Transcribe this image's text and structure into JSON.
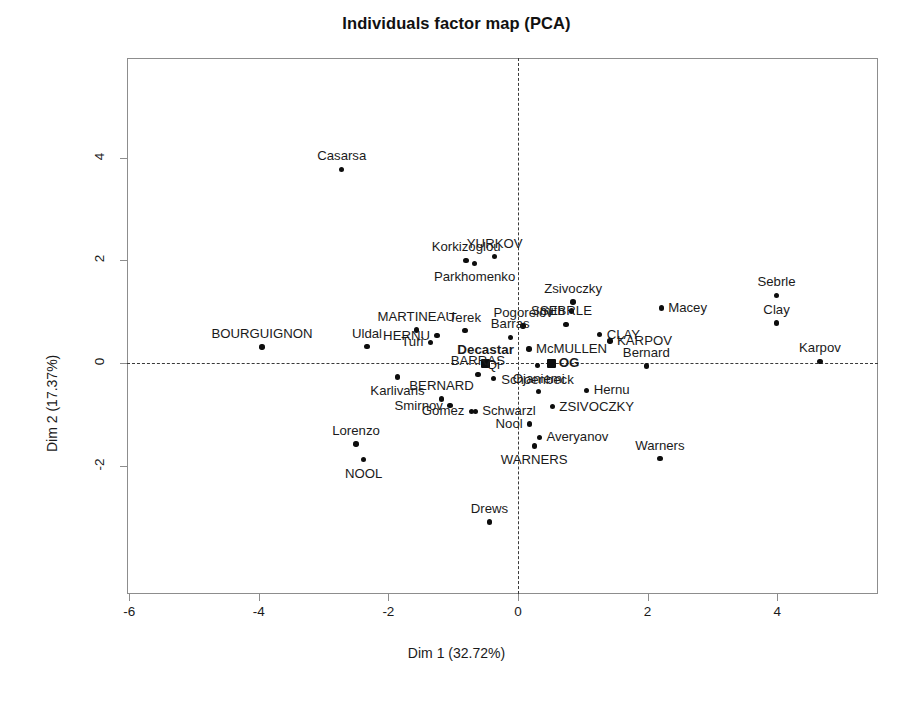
{
  "chart_data": {
    "type": "scatter",
    "title": "Individuals factor map (PCA)",
    "xlabel": "Dim 1 (32.72%)",
    "ylabel": "Dim 2 (17.37%)",
    "xlim": [
      -6.6,
      5.4
    ],
    "ylim": [
      -3.6,
      4.6
    ],
    "xticks": [
      -6,
      -4,
      -2,
      0,
      2,
      4
    ],
    "xticklabels": [
      "-6",
      "-4",
      "-2",
      "0",
      "2",
      "4"
    ],
    "yticks": [
      4,
      2,
      0,
      -2
    ],
    "yticklabels": [
      "4",
      "2",
      "0",
      "-2"
    ],
    "grid": false,
    "legend": "none",
    "reference_lines": {
      "horizontal": 0,
      "vertical": 0,
      "style": "dashed"
    },
    "marker_color": "#0d0d0d",
    "frame_color": "#8d8d8d",
    "points": [
      {
        "label": "Casarsa",
        "x": -2.72,
        "y": 3.77,
        "marker": "circle",
        "bold": false,
        "anchor": "c"
      },
      {
        "label": "Korkizoglou",
        "x": -0.8,
        "y": 2.0,
        "marker": "circle",
        "bold": false,
        "anchor": "c"
      },
      {
        "label": "Parkhomenko",
        "x": -0.67,
        "y": 1.94,
        "marker": "circle",
        "bold": false,
        "anchor": "b"
      },
      {
        "label": "YURKOV",
        "x": -0.36,
        "y": 2.07,
        "marker": "circle",
        "bold": false,
        "anchor": "c"
      },
      {
        "label": "Sebrle",
        "x": 3.99,
        "y": 1.32,
        "marker": "circle",
        "bold": false,
        "anchor": "c"
      },
      {
        "label": "Zsivoczky",
        "x": 0.85,
        "y": 1.19,
        "marker": "circle",
        "bold": false,
        "anchor": "c"
      },
      {
        "label": "Smith",
        "x": 0.83,
        "y": 1.01,
        "marker": "circle",
        "bold": false,
        "anchor": "l"
      },
      {
        "label": "Macey",
        "x": 2.21,
        "y": 1.07,
        "marker": "circle",
        "bold": false,
        "anchor": "r"
      },
      {
        "label": "Clay",
        "x": 3.99,
        "y": 0.78,
        "marker": "circle",
        "bold": false,
        "anchor": "c"
      },
      {
        "label": "Pogorelov",
        "x": 0.08,
        "y": 0.72,
        "marker": "circle",
        "bold": false,
        "anchor": "c"
      },
      {
        "label": "SEBRLE",
        "x": 0.74,
        "y": 0.75,
        "marker": "circle",
        "bold": false,
        "anchor": "c"
      },
      {
        "label": "MARTINEAU",
        "x": -1.57,
        "y": 0.64,
        "marker": "circle",
        "bold": false,
        "anchor": "c"
      },
      {
        "label": "Terek",
        "x": -0.82,
        "y": 0.63,
        "marker": "circle",
        "bold": false,
        "anchor": "c"
      },
      {
        "label": "CLAY",
        "x": 1.26,
        "y": 0.55,
        "marker": "circle",
        "bold": false,
        "anchor": "r"
      },
      {
        "label": "HERNU",
        "x": -1.25,
        "y": 0.53,
        "marker": "circle",
        "bold": false,
        "anchor": "l"
      },
      {
        "label": "Barras",
        "x": -0.12,
        "y": 0.5,
        "marker": "circle",
        "bold": false,
        "anchor": "c"
      },
      {
        "label": "KARPOV",
        "x": 1.42,
        "y": 0.43,
        "marker": "circle",
        "bold": false,
        "anchor": "r"
      },
      {
        "label": "BOURGUIGNON",
        "x": -3.95,
        "y": 0.31,
        "marker": "circle",
        "bold": false,
        "anchor": "c"
      },
      {
        "label": "Uldal",
        "x": -2.33,
        "y": 0.32,
        "marker": "circle",
        "bold": false,
        "anchor": "c"
      },
      {
        "label": "Turi",
        "x": -1.35,
        "y": 0.4,
        "marker": "circle",
        "bold": false,
        "anchor": "l"
      },
      {
        "label": "McMULLEN",
        "x": 0.17,
        "y": 0.27,
        "marker": "circle",
        "bold": false,
        "anchor": "r"
      },
      {
        "label": "Karpov",
        "x": 4.66,
        "y": 0.03,
        "marker": "circle",
        "bold": false,
        "anchor": "c"
      },
      {
        "label": "Decastar",
        "x": -0.5,
        "y": 0.0,
        "marker": "square",
        "bold": true,
        "anchor": "c"
      },
      {
        "label": "OG",
        "x": 0.52,
        "y": 0.0,
        "marker": "square",
        "bold": true,
        "anchor": "r"
      },
      {
        "label": "Bernard",
        "x": 1.98,
        "y": -0.06,
        "marker": "circle",
        "bold": false,
        "anchor": "c"
      },
      {
        "label": "Schoenbeck",
        "x": 0.3,
        "y": -0.05,
        "marker": "circle",
        "bold": false,
        "anchor": "b"
      },
      {
        "label": "BARRAS",
        "x": -0.62,
        "y": -0.22,
        "marker": "circle",
        "bold": false,
        "anchor": "c"
      },
      {
        "label": "Karlivans",
        "x": -1.86,
        "y": -0.27,
        "marker": "circle",
        "bold": false,
        "anchor": "b"
      },
      {
        "label": "Qi",
        "x": -0.38,
        "y": -0.3,
        "marker": "circle",
        "bold": false,
        "anchor": "c"
      },
      {
        "label": "Ojaniemi",
        "x": 0.32,
        "y": -0.56,
        "marker": "circle",
        "bold": false,
        "anchor": "c"
      },
      {
        "label": "Hernu",
        "x": 1.06,
        "y": -0.53,
        "marker": "circle",
        "bold": false,
        "anchor": "r"
      },
      {
        "label": "BERNARD",
        "x": -1.18,
        "y": -0.7,
        "marker": "circle",
        "bold": false,
        "anchor": "c"
      },
      {
        "label": "Smirnov",
        "x": -1.05,
        "y": -0.83,
        "marker": "circle",
        "bold": false,
        "anchor": "l"
      },
      {
        "label": "ZSIVOCZKY",
        "x": 0.53,
        "y": -0.85,
        "marker": "circle",
        "bold": false,
        "anchor": "r"
      },
      {
        "label": "Gomez",
        "x": -0.72,
        "y": -0.94,
        "marker": "circle",
        "bold": false,
        "anchor": "l"
      },
      {
        "label": "Schwarzl",
        "x": -0.66,
        "y": -0.94,
        "marker": "circle",
        "bold": false,
        "anchor": "r"
      },
      {
        "label": "Nool",
        "x": 0.18,
        "y": -1.19,
        "marker": "circle",
        "bold": false,
        "anchor": "l"
      },
      {
        "label": "Lorenzo",
        "x": -2.5,
        "y": -1.58,
        "marker": "circle",
        "bold": false,
        "anchor": "c"
      },
      {
        "label": "Averyanov",
        "x": 0.33,
        "y": -1.45,
        "marker": "circle",
        "bold": false,
        "anchor": "r"
      },
      {
        "label": "WARNERS",
        "x": 0.25,
        "y": -1.62,
        "marker": "circle",
        "bold": false,
        "anchor": "b"
      },
      {
        "label": "Warners",
        "x": 2.19,
        "y": -1.86,
        "marker": "circle",
        "bold": false,
        "anchor": "c"
      },
      {
        "label": "NOOL",
        "x": -2.38,
        "y": -1.88,
        "marker": "circle",
        "bold": false,
        "anchor": "b"
      },
      {
        "label": "Drews",
        "x": -0.44,
        "y": -3.1,
        "marker": "circle",
        "bold": false,
        "anchor": "c"
      }
    ]
  }
}
